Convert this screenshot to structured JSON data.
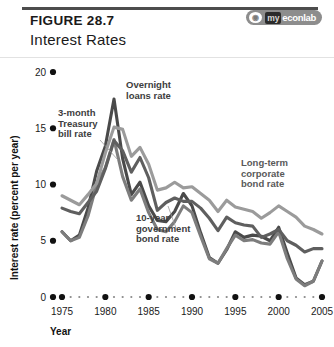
{
  "figure": {
    "label": "FIGURE 28.7",
    "title": "Interest Rates",
    "logo": {
      "mark": "ℝ",
      "dark_text": "my",
      "light_text": "econlab"
    }
  },
  "colors": {
    "overnight": "#4a4a4a",
    "treasury": "#7d7d7d",
    "ten_year": "#5f5f5f",
    "corporate": "#9b9b9b",
    "axis": "#111111",
    "rule": "#4d4d4d"
  },
  "chart_data": {
    "type": "line",
    "title": "Interest Rates",
    "xlabel": "Year",
    "ylabel": "Interest rate (percent per year)",
    "xlim": [
      1975,
      2005
    ],
    "ylim": [
      0,
      20
    ],
    "ytick_labels": [
      "0",
      "5",
      "10",
      "15",
      "20"
    ],
    "yticks": [
      0,
      5,
      10,
      15,
      20
    ],
    "xtick_labels": [
      "1975",
      "1980",
      "1985",
      "1990",
      "1995",
      "2000",
      "2005"
    ],
    "xticks": [
      1975,
      1980,
      1985,
      1990,
      1995,
      2000,
      2005
    ],
    "minor_xticks": [
      1976,
      1977,
      1978,
      1979,
      1981,
      1982,
      1983,
      1984,
      1986,
      1987,
      1988,
      1989,
      1991,
      1992,
      1993,
      1994,
      1996,
      1997,
      1998,
      1999,
      2001,
      2002,
      2003,
      2004
    ],
    "grid": false,
    "legend": "annotations",
    "x": [
      1975,
      1976,
      1977,
      1978,
      1979,
      1980,
      1981,
      1982,
      1983,
      1984,
      1985,
      1986,
      1987,
      1988,
      1989,
      1990,
      1991,
      1992,
      1993,
      1994,
      1995,
      1996,
      1997,
      1998,
      1999,
      2000,
      2001,
      2002,
      2003,
      2004,
      2005
    ],
    "series": [
      {
        "name": "Overnight loans rate",
        "label_lines": [
          "Overnight",
          "loans rate"
        ],
        "color": "#4a4a4a",
        "values": [
          5.8,
          5.0,
          5.5,
          7.9,
          11.2,
          13.4,
          17.6,
          12.3,
          9.1,
          10.2,
          8.1,
          6.8,
          6.7,
          7.6,
          9.2,
          8.1,
          5.7,
          3.5,
          3.0,
          4.2,
          5.8,
          5.3,
          5.5,
          5.4,
          5.0,
          6.2,
          3.9,
          1.7,
          1.1,
          1.4,
          3.2
        ]
      },
      {
        "name": "3-month Treasury bill rate",
        "label_lines": [
          "3-month",
          "Treasury",
          "bill rate"
        ],
        "color": "#7d7d7d",
        "values": [
          5.8,
          5.0,
          5.3,
          7.2,
          10.0,
          11.5,
          14.0,
          10.7,
          8.6,
          9.6,
          7.5,
          6.0,
          5.8,
          6.7,
          8.1,
          7.5,
          5.4,
          3.4,
          3.0,
          4.3,
          5.5,
          5.0,
          5.1,
          4.8,
          4.7,
          5.8,
          3.4,
          1.6,
          1.0,
          1.4,
          3.2
        ]
      },
      {
        "name": "10-year government bond rate",
        "label_lines": [
          "10-year",
          "government",
          "bond rate"
        ],
        "color": "#5f5f5f",
        "values": [
          7.9,
          7.6,
          7.4,
          8.4,
          9.4,
          11.4,
          13.9,
          13.0,
          11.1,
          12.4,
          10.6,
          7.7,
          8.4,
          8.8,
          8.5,
          8.5,
          7.9,
          7.0,
          5.9,
          7.1,
          6.6,
          6.4,
          6.3,
          5.3,
          5.6,
          6.0,
          5.0,
          4.6,
          4.0,
          4.3,
          4.3
        ]
      },
      {
        "name": "Long-term corporate bond rate",
        "label_lines": [
          "Long-term",
          "corporate",
          "bond rate"
        ],
        "color": "#9b9b9b",
        "values": [
          9.0,
          8.6,
          8.2,
          9.1,
          10.1,
          12.8,
          15.1,
          14.9,
          12.5,
          13.3,
          11.8,
          9.5,
          9.7,
          10.2,
          9.7,
          9.8,
          9.2,
          8.6,
          7.6,
          8.6,
          8.0,
          7.8,
          7.6,
          7.0,
          7.5,
          8.1,
          7.6,
          7.1,
          6.3,
          6.0,
          5.6
        ]
      }
    ]
  }
}
